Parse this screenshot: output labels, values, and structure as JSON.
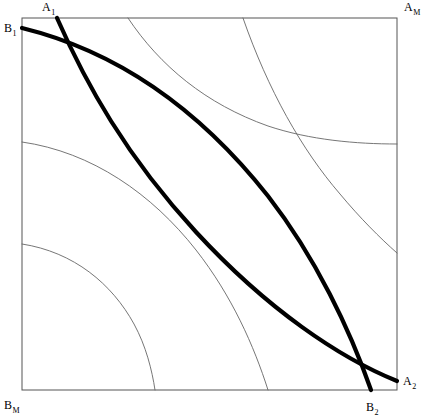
{
  "figure": {
    "type": "diagram",
    "width": 425,
    "height": 420,
    "background_color": "#ffffff"
  },
  "box": {
    "name": "edgeworth-box-frame",
    "left": 22,
    "top": 18,
    "right": 397,
    "bottom": 390,
    "stroke_color": "#555555",
    "stroke_width": 1
  },
  "labels": {
    "top_left": {
      "base": "A",
      "sub": "1"
    },
    "top_right": {
      "base": "A",
      "sub": "M"
    },
    "upper_left_origin": {
      "base": "B",
      "sub": "1"
    },
    "right_end": {
      "base": "A",
      "sub": "2"
    },
    "bottom_end": {
      "base": "B",
      "sub": "2"
    },
    "bottom_left": {
      "base": "B",
      "sub": "M"
    }
  },
  "curves": {
    "thick": {
      "stroke_color": "#000000",
      "stroke_width": 4.2,
      "items": [
        {
          "name": "thick-curve-B1-B2",
          "from_label": "B1",
          "to_label": "B2",
          "start": [
            22,
            28
          ],
          "end": [
            371,
            390
          ],
          "path": "M 22 28 C 120 52 200 110 268 196 C 316 258 350 330 371 390"
        },
        {
          "name": "thick-curve-A1-A2",
          "from_label": "A1",
          "to_label": "A2",
          "start": [
            57,
            18
          ],
          "end": [
            397,
            381
          ],
          "path": "M 57 18 C 86 84 126 156 196 232 C 268 310 340 358 397 381"
        }
      ]
    },
    "thin": {
      "stroke_color": "#666666",
      "stroke_width": 0.9,
      "items": [
        {
          "name": "thin-curve-upper-right-1",
          "start": [
            128,
            18
          ],
          "end": [
            397,
            144
          ],
          "path": "M 128 18 C 160 66 206 104 268 126 C 310 140 356 144 397 144"
        },
        {
          "name": "thin-curve-upper-right-2",
          "start": [
            243,
            18
          ],
          "end": [
            397,
            253
          ],
          "path": "M 243 18 C 268 90 302 150 340 194 C 360 218 380 238 397 253"
        },
        {
          "name": "thin-curve-lower-left-1",
          "start": [
            22,
            142
          ],
          "end": [
            268,
            390
          ],
          "path": "M 22 142 C 92 152 152 194 196 250 C 232 296 254 346 268 390"
        },
        {
          "name": "thin-curve-lower-left-2",
          "start": [
            22,
            244
          ],
          "end": [
            155,
            390
          ],
          "path": "M 22 244 C 74 252 112 284 134 324 C 146 346 152 370 155 390"
        }
      ]
    }
  }
}
